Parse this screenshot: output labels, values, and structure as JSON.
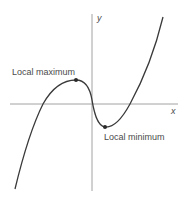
{
  "diagram": {
    "axes": {
      "x_label": "x",
      "y_label": "y"
    },
    "annotations": {
      "local_max": "Local maximum",
      "local_min": "Local minimum"
    },
    "colors": {
      "axis": "#8a8a8a",
      "curve": "#3a3a3a",
      "text": "#4a4a4a"
    }
  }
}
